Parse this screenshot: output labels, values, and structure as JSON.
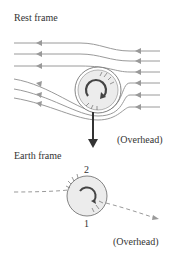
{
  "rest_frame": {
    "title": "Rest frame",
    "caption": "(Overhead)"
  },
  "earth_frame": {
    "title": "Earth frame",
    "caption": "(Overhead)",
    "point_top": "2",
    "point_bottom": "1"
  },
  "colors": {
    "flow_line": "#9a9a9a",
    "ball_fill": "#ececec",
    "ball_stroke": "#666666",
    "arrow": "#333333",
    "text": "#333333"
  }
}
